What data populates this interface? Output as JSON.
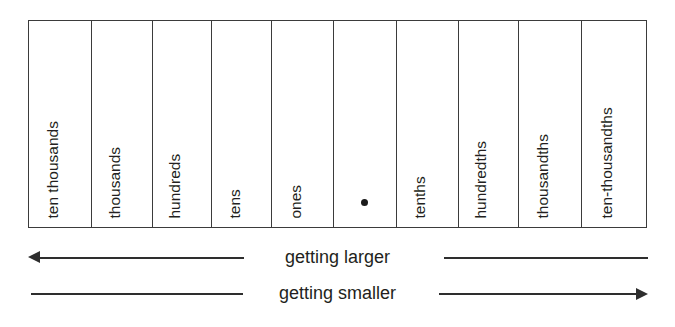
{
  "figure": {
    "type": "place-value-chart",
    "background_color": "#ffffff",
    "line_color": "#3b3b3b",
    "text_color": "#231f20"
  },
  "chart_data": {
    "type": "table",
    "title": "",
    "orientation": "vertical-labels",
    "columns": [
      {
        "index": 0,
        "label": "ten thousands",
        "group": "whole",
        "value": 10000,
        "left": 28,
        "right": 91
      },
      {
        "index": 1,
        "label": "thousands",
        "group": "whole",
        "value": 1000,
        "left": 91,
        "right": 152
      },
      {
        "index": 2,
        "label": "hundreds",
        "group": "whole",
        "value": 100,
        "left": 152,
        "right": 212
      },
      {
        "index": 3,
        "label": "tens",
        "group": "whole",
        "value": 10,
        "left": 212,
        "right": 272
      },
      {
        "index": 4,
        "label": "ones",
        "group": "whole",
        "value": 1,
        "left": 272,
        "right": 334
      },
      {
        "index": 5,
        "label": "",
        "group": "point",
        "value": null,
        "left": 334,
        "right": 397,
        "marker": "decimal-point"
      },
      {
        "index": 6,
        "label": "tenths",
        "group": "decimal",
        "value": 0.1,
        "left": 397,
        "right": 459
      },
      {
        "index": 7,
        "label": "hundredths",
        "group": "decimal",
        "value": 0.01,
        "left": 459,
        "right": 520
      },
      {
        "index": 8,
        "label": "thousandths",
        "group": "decimal",
        "value": 0.001,
        "left": 520,
        "right": 583
      },
      {
        "index": 9,
        "label": "ten-thousandths",
        "group": "decimal",
        "value": 0.0001,
        "left": 583,
        "right": 647
      }
    ],
    "annotations": [
      {
        "name": "getting-larger",
        "text": "getting larger",
        "direction": "left",
        "arrowhead": "left-end"
      },
      {
        "name": "getting-smaller",
        "text": "getting smaller",
        "direction": "right",
        "arrowhead": "right-end"
      }
    ]
  },
  "annotations": {
    "larger": {
      "caption": "getting larger",
      "arrow_direction": "left"
    },
    "smaller": {
      "caption": "getting smaller",
      "arrow_direction": "right"
    }
  }
}
